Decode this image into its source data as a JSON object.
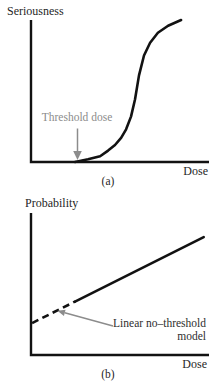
{
  "figure": {
    "panel_a": {
      "y_axis_label": "Seriousness",
      "x_axis_label": "Dose",
      "caption": "(a)",
      "annotation": "Threshold dose"
    },
    "panel_b": {
      "y_axis_label": "Probability",
      "x_axis_label": "Dose",
      "caption": "(b)",
      "annotation_line1": "Linear no–threshold",
      "annotation_line2": "model"
    },
    "colors": {
      "curve": "#121212",
      "axis": "#121212",
      "gray_annotation": "#8c8c8c",
      "label_text": "#1f1f1f"
    }
  },
  "chart_data": [
    {
      "type": "line",
      "panel": "a",
      "title": "",
      "xlabel": "Dose",
      "ylabel": "Seriousness",
      "caption": "(a)",
      "axis_numeric": false,
      "grid": false,
      "description": "Threshold (sigmoid) dose-response curve: no effect below the threshold dose, then steep rise that saturates. Axes are qualitative (no tick values); coordinates below are normalized 0-1 fractions of each axis.",
      "annotations": [
        {
          "text": "Threshold dose",
          "color": "#8c8c8c",
          "arrow": "points down to x-axis where curve begins",
          "target_x": 0.26,
          "target_y": 0.0
        }
      ],
      "series": [
        {
          "name": "threshold dose-response curve",
          "points": [
            [
              0.247,
              0.0
            ],
            [
              0.32,
              0.02
            ],
            [
              0.388,
              0.04
            ],
            [
              0.433,
              0.08
            ],
            [
              0.472,
              0.12
            ],
            [
              0.506,
              0.17
            ],
            [
              0.534,
              0.23
            ],
            [
              0.562,
              0.32
            ],
            [
              0.584,
              0.44
            ],
            [
              0.607,
              0.61
            ],
            [
              0.635,
              0.75
            ],
            [
              0.669,
              0.84
            ],
            [
              0.713,
              0.91
            ],
            [
              0.77,
              0.96
            ],
            [
              0.843,
              1.0
            ]
          ]
        }
      ]
    },
    {
      "type": "line",
      "panel": "b",
      "title": "",
      "xlabel": "Dose",
      "ylabel": "Probability",
      "caption": "(b)",
      "axis_numeric": false,
      "grid": false,
      "description": "Linear no-threshold model: straight line, extrapolated toward zero dose as a dashed segment. Gray arrow from the label points at the dashed extrapolation. Normalized 0-1 coordinates.",
      "annotations": [
        {
          "text": "Linear no–threshold model",
          "color": "#8c8c8c",
          "arrow": "points up-left at dashed segment",
          "target_x": 0.15,
          "target_y": 0.31
        }
      ],
      "series": [
        {
          "name": "linear no-threshold line",
          "points": [
            [
              0.006,
              0.225
            ],
            [
              0.97,
              0.83
            ]
          ],
          "dashed_until_x": 0.25
        }
      ]
    }
  ]
}
